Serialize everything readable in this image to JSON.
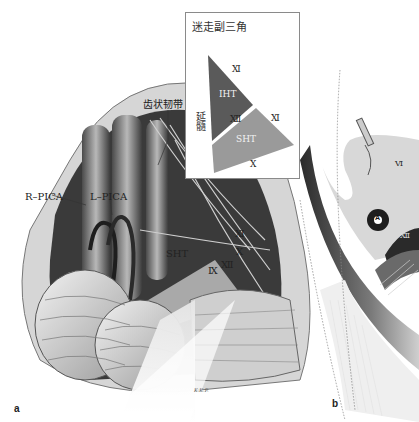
{
  "figure": {
    "panels": [
      {
        "letter": "a"
      },
      {
        "letter": "b"
      }
    ],
    "panel_a": {
      "labels": {
        "r_pica": "R–PICA",
        "l_pica": "L–PICA",
        "dentate_ligament": "齿状韧带",
        "cn_xii": "Ⅻ",
        "cn_xi": "Ⅺ",
        "cn_x": "Ⅹ",
        "cn_ix": "Ⅸ",
        "sht": "SHT",
        "signature": "K.K.P."
      }
    },
    "inset": {
      "title": "迷走副三角",
      "medulla_label": "延髓",
      "iht": "IHT",
      "sht": "SHT",
      "cn_xi_top": "Ⅺ",
      "cn_xii": "Ⅻ",
      "cn_xi_right": "Ⅺ",
      "cn_x": "Ⅹ",
      "colors": {
        "iht": "#5a5a5a",
        "sht": "#9a9a9a",
        "border": "#8a8a8a"
      }
    },
    "panel_b": {
      "labels": {
        "marker_a": "A",
        "cn_vi": "Ⅵ",
        "cn_xii": "Ⅻ"
      }
    }
  }
}
